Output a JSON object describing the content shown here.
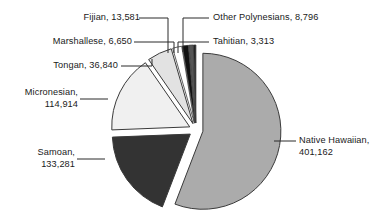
{
  "chart_data": {
    "type": "pie",
    "title": "",
    "subtitle": "",
    "xlabel": "",
    "ylabel": "",
    "legend_position": "none",
    "grid": false,
    "exploded": true,
    "start_angle_deg": 0,
    "direction": "clockwise",
    "total": 718537,
    "categories": [
      "Native Hawaiian",
      "Samoan",
      "Micronesian",
      "Tongan",
      "Fijian",
      "Other Polynesians",
      "Marshallese",
      "Tahitian"
    ],
    "values": [
      401162,
      133281,
      114914,
      36840,
      13581,
      8796,
      6650,
      3313
    ],
    "slices": [
      {
        "name": "Native Hawaiian",
        "value": 401162,
        "value_text": "401,162",
        "label_text": "Native Hawaiian, 401,162",
        "label_line1": "Native Hawaiian,",
        "label_line2": "401,162",
        "percent": 55.8,
        "angle_deg": 201.0,
        "color": "#ababab"
      },
      {
        "name": "Samoan",
        "value": 133281,
        "value_text": "133,281",
        "label_text": "Samoan, 133,281",
        "label_line1": "Samoan,",
        "label_line2": "133,281",
        "percent": 18.5,
        "angle_deg": 66.8,
        "color": "#333333"
      },
      {
        "name": "Micronesian",
        "value": 114914,
        "value_text": "114,914",
        "label_text": "Micronesian, 114,914",
        "label_line1": "Micronesian,",
        "label_line2": "114,914",
        "percent": 16.0,
        "angle_deg": 57.6,
        "color": "#f0f0f0"
      },
      {
        "name": "Tongan",
        "value": 36840,
        "value_text": "36,840",
        "label_text": "Tongan, 36,840",
        "percent": 5.1,
        "angle_deg": 18.5,
        "color": "#e2e2e2"
      },
      {
        "name": "Fijian",
        "value": 13581,
        "value_text": "13,581",
        "label_text": "Fijian, 13,581",
        "percent": 1.9,
        "angle_deg": 6.8,
        "color": "#ffffff"
      },
      {
        "name": "Other Polynesians",
        "value": 8796,
        "value_text": "8,796",
        "label_text": "Other Polynesians, 8,796",
        "percent": 1.2,
        "angle_deg": 4.4,
        "color": "#111111"
      },
      {
        "name": "Marshallese",
        "value": 6650,
        "value_text": "6,650",
        "label_text": "Marshallese, 6,650",
        "percent": 0.9,
        "angle_deg": 3.3,
        "color": "#555555"
      },
      {
        "name": "Tahitian",
        "value": 3313,
        "value_text": "3,313",
        "label_text": "Tahitian, 3,313",
        "percent": 0.5,
        "angle_deg": 1.7,
        "color": "#1f1f1f"
      }
    ]
  },
  "labels": {
    "fijian": "Fijian, 13,581",
    "other_polynesians": "Other Polynesians, 8,796",
    "marshallese": "Marshallese, 6,650",
    "tahitian": "Tahitian, 3,313",
    "tongan": "Tongan, 36,840",
    "micronesian_line1": "Micronesian,",
    "micronesian_line2": "114,914",
    "samoan_line1": "Samoan,",
    "samoan_line2": "133,281",
    "native_hawaiian_line1": "Native Hawaiian,",
    "native_hawaiian_line2": "401,162"
  },
  "colors": {
    "background": "#ffffff",
    "outline": "#3a3a3a",
    "leader_line": "#2b2b2b",
    "text": "#1a1a1a"
  }
}
